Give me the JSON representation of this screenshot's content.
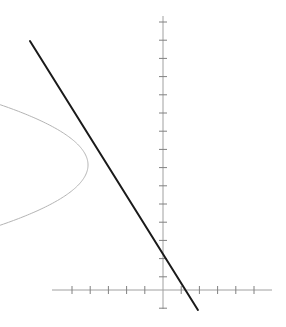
{
  "figure": {
    "title": "",
    "width": 286,
    "height": 327,
    "background_color": "#ffffff"
  },
  "chart_data": {
    "type": "line",
    "title": "",
    "subtitle": "",
    "xlabel": "",
    "ylabel": "",
    "grid": false,
    "legend": null,
    "annotations": [],
    "axes": {
      "origin_px": [
        163,
        290
      ],
      "unit_px": 18.2,
      "x_axis": {
        "label": "",
        "tick_labels": [],
        "axis_start_px": 52,
        "axis_end_px": 272,
        "tick_count": 12,
        "tick_spacing_px": 18.2,
        "tick_half_length_px": 4,
        "xlim": [
          -6.1,
          6.0
        ],
        "color": "#a0a0a0"
      },
      "y_axis": {
        "label": "",
        "tick_labels": [],
        "axis_start_px": 16,
        "axis_end_px": 309,
        "tick_count": 15,
        "tick_spacing_px": 18.2,
        "tick_half_length_px": 4,
        "ylim": [
          -1.0,
          15.0
        ],
        "color": "#a0a0a0"
      }
    },
    "series": [
      {
        "name": "curve",
        "role": "parabola",
        "style": "solid",
        "color": "#b4b4b4",
        "width_px": 1,
        "description": "leftward-opening parabola, vertex at right",
        "vertex": [
          -4.12,
          6.87
        ],
        "opens": "left",
        "a": -0.44,
        "x": [
          -4.12,
          -4.13,
          -4.17,
          -4.23,
          -4.32,
          -4.44,
          -4.58,
          -4.75,
          -4.95,
          -5.17,
          -5.42,
          -5.69,
          -5.99,
          -6.31,
          -6.66,
          -7.03,
          -7.43,
          -7.85,
          -8.24,
          -4.13,
          -4.17,
          -4.23,
          -4.32,
          -4.44,
          -4.58,
          -4.75,
          -4.95,
          -5.17,
          -5.42,
          -5.69,
          -5.99,
          -6.31,
          -6.66,
          -7.03,
          -7.43,
          -7.85,
          -8.24
        ],
        "y": [
          6.87,
          7.12,
          7.37,
          7.62,
          7.87,
          8.12,
          8.37,
          8.62,
          8.87,
          9.12,
          9.37,
          9.62,
          9.87,
          10.12,
          10.37,
          10.62,
          10.87,
          11.12,
          11.34,
          6.62,
          6.37,
          6.12,
          5.87,
          5.62,
          5.37,
          5.12,
          4.87,
          4.62,
          4.37,
          4.12,
          3.87,
          3.62,
          3.37,
          3.12,
          2.87,
          2.62,
          2.4
        ],
        "endpoints_px": [
          [
            13,
            41
          ],
          [
            88,
            165
          ],
          [
            13,
            292
          ]
        ]
      },
      {
        "name": "tangent-line",
        "role": "tangent",
        "style": "solid",
        "color": "#1a1a1a",
        "width_px": 2,
        "description": "straight tangent line to the parabola",
        "slope": -1.6,
        "intercept": -2.28,
        "tangent_point": [
          -5.38,
          10.6
        ],
        "x_intercept": -1.43,
        "points": [
          [
            -7.31,
            13.68
          ],
          [
            1.92,
            -1.1
          ]
        ],
        "endpoints_px": [
          [
            30,
            41
          ],
          [
            198,
            310
          ]
        ]
      }
    ]
  },
  "colors": {
    "axis": "#a0a0a0",
    "tick": "#808080",
    "curve": "#b4b4b4",
    "line": "#1a1a1a",
    "background": "#ffffff"
  }
}
